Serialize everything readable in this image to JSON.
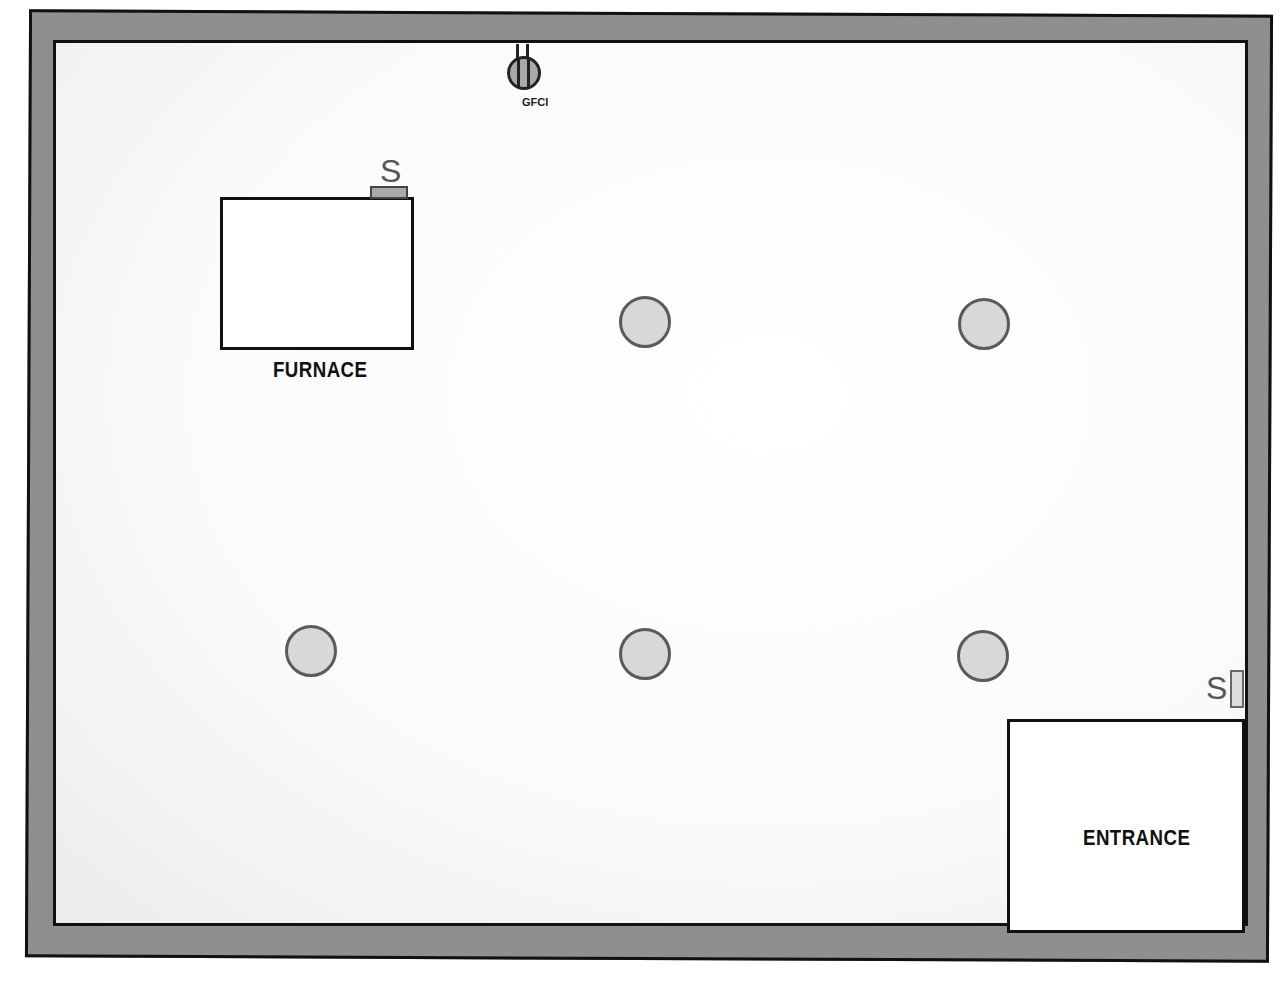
{
  "diagram": {
    "type": "basement floor plan",
    "colors": {
      "wall": "#8f8f8f",
      "outline": "#111111",
      "floor": "#fbfbfb",
      "light_fill": "#d8d8d8",
      "light_border": "#5a5a5a"
    },
    "gfci": {
      "label": "GFCI"
    },
    "furnace": {
      "label": "FURNACE",
      "switch_label": "S"
    },
    "entrance": {
      "label": "ENTRANCE",
      "switch_label": "S"
    },
    "light_fixtures": [
      {
        "row": 1,
        "col": 2
      },
      {
        "row": 1,
        "col": 3
      },
      {
        "row": 2,
        "col": 1
      },
      {
        "row": 2,
        "col": 2
      },
      {
        "row": 2,
        "col": 3
      }
    ]
  }
}
